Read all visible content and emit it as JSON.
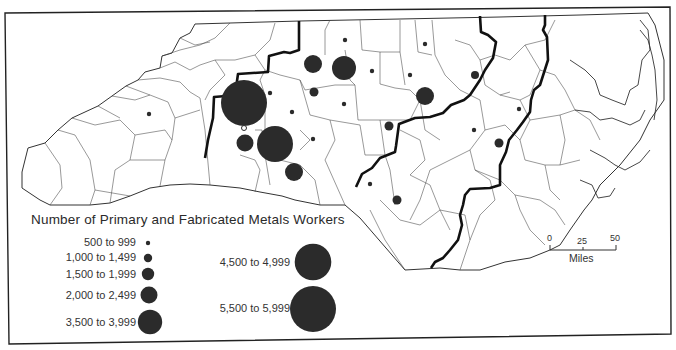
{
  "map": {
    "region": "North Carolina",
    "legend": {
      "title": "Number of Primary and Fabricated Metals Workers",
      "classes": [
        {
          "label": "500 to 999",
          "radius": 2.2
        },
        {
          "label": "1,000 to 1,499",
          "radius": 4.2
        },
        {
          "label": "1,500 to 1,999",
          "radius": 6.2
        },
        {
          "label": "2,000 to 2,499",
          "radius": 8.5
        },
        {
          "label": "3,500 to 3,999",
          "radius": 12.2
        },
        {
          "label": "4,500 to 4,999",
          "radius": 18.3
        },
        {
          "label": "5,500 to 5,999",
          "radius": 23
        }
      ]
    },
    "scale_bar": {
      "ticks": [
        "0",
        "25",
        "50"
      ],
      "unit": "Miles"
    },
    "symbols": [
      {
        "class": "5,500 to 5,999",
        "x": 244,
        "y": 103
      },
      {
        "class": "4,500 to 4,999",
        "x": 275,
        "y": 144
      },
      {
        "class": "3,500 to 3,999",
        "x": 344,
        "y": 68
      },
      {
        "class": "2,000 to 2,499",
        "x": 313,
        "y": 64
      },
      {
        "class": "2,000 to 2,499",
        "x": 245,
        "y": 143
      },
      {
        "class": "2,000 to 2,499",
        "x": 294,
        "y": 172
      },
      {
        "class": "2,000 to 2,499",
        "x": 425,
        "y": 96
      },
      {
        "class": "1,500 to 1,999",
        "x": 314,
        "y": 92
      },
      {
        "class": "1,500 to 1,999",
        "x": 390,
        "y": 126
      },
      {
        "class": "1,500 to 1,999",
        "x": 499,
        "y": 143
      },
      {
        "class": "1,500 to 1,999",
        "x": 397,
        "y": 200
      },
      {
        "class": "1,000 to 1,499",
        "x": 475,
        "y": 75
      },
      {
        "class": "500 to 999",
        "x": 345,
        "y": 40
      },
      {
        "class": "500 to 999",
        "x": 425,
        "y": 44
      },
      {
        "class": "500 to 999",
        "x": 372,
        "y": 71
      },
      {
        "class": "500 to 999",
        "x": 410,
        "y": 75
      },
      {
        "class": "500 to 999",
        "x": 270,
        "y": 92
      },
      {
        "class": "500 to 999",
        "x": 292,
        "y": 112
      },
      {
        "class": "500 to 999",
        "x": 344,
        "y": 104
      },
      {
        "class": "500 to 999",
        "x": 313,
        "y": 138
      },
      {
        "class": "500 to 999",
        "x": 244,
        "y": 128
      },
      {
        "class": "500 to 999",
        "x": 149,
        "y": 114
      },
      {
        "class": "500 to 999",
        "x": 370,
        "y": 184
      },
      {
        "class": "500 to 999",
        "x": 519,
        "y": 109
      },
      {
        "class": "500 to 999",
        "x": 474,
        "y": 130
      }
    ]
  }
}
